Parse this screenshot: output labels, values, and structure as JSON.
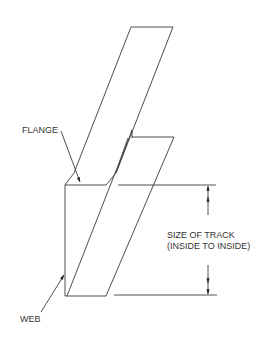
{
  "diagram": {
    "labels": {
      "flange": "FLANGE",
      "web": "WEB",
      "dimension_line1": "SIZE OF TRACK",
      "dimension_line2": "(INSIDE TO INSIDE)"
    },
    "colors": {
      "line": "#3a3a3a",
      "text": "#333333",
      "background": "#ffffff"
    }
  }
}
